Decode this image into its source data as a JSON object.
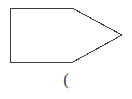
{
  "canvas": {
    "width": 132,
    "height": 99,
    "background_color": "#ffffff"
  },
  "diagram": {
    "title": "",
    "stroke_color": "#3a3a3a",
    "fill_color": "none",
    "stroke_width": 1,
    "shapes": [
      {
        "name": "pentagon-arrow-outline",
        "kind": "polygon",
        "description": "rectangle with pointed right end (arrow / pentagon block)",
        "points": "10,8 72,8 122,35 73,62 10,62",
        "vertices": [
          {
            "x": 10,
            "y": 8
          },
          {
            "x": 72,
            "y": 8
          },
          {
            "x": 122,
            "y": 35
          },
          {
            "x": 73,
            "y": 62
          },
          {
            "x": 10,
            "y": 62
          }
        ]
      }
    ]
  },
  "caption": {
    "text": "(",
    "glyph_name": "left-parenthesis",
    "color": "#3a3a3a"
  }
}
